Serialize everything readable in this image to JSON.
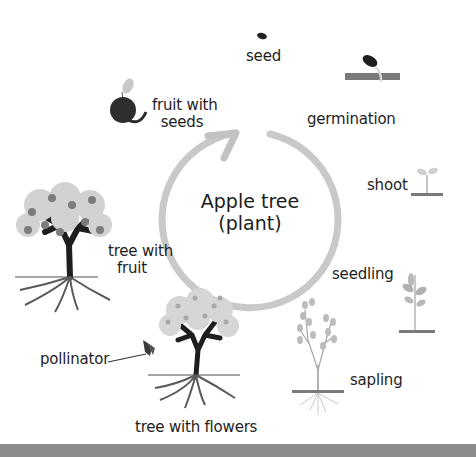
{
  "diagram": {
    "center": {
      "line1": "Apple tree",
      "line2": "(plant)"
    },
    "stages": [
      {
        "id": "seed",
        "label": "seed"
      },
      {
        "id": "germination",
        "label": "germination"
      },
      {
        "id": "shoot",
        "label": "shoot"
      },
      {
        "id": "seedling",
        "label": "seedling"
      },
      {
        "id": "sapling",
        "label": "sapling"
      },
      {
        "id": "tree-with-flowers",
        "label": "tree with flowers"
      },
      {
        "id": "tree-with-fruit",
        "label_line1": "tree with",
        "label_line2": "fruit"
      },
      {
        "id": "fruit-with-seeds",
        "label_line1": "fruit with",
        "label_line2": "seeds"
      }
    ],
    "extra_labels": {
      "pollinator": "pollinator"
    },
    "colors": {
      "cycle_arrow": "#c8c8c8",
      "ground": "#7a7a7a",
      "plant_foliage": "#a8a8a8",
      "trunk": "#1e1e1e",
      "bottom_bar": "#8c8c8c"
    }
  }
}
